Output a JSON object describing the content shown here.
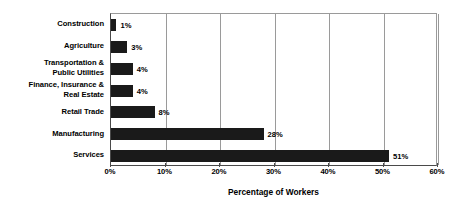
{
  "chart_data": {
    "type": "bar",
    "orientation": "horizontal",
    "title": "",
    "xlabel": "Percentage of Workers",
    "ylabel": "",
    "categories": [
      "Construction",
      "Agriculture",
      "Transportation &\nPublic Utilities",
      "Finance, Insurance &\nReal Estate",
      "Retail Trade",
      "Manufacturing",
      "Services"
    ],
    "values": [
      1,
      3,
      4,
      4,
      8,
      28,
      51
    ],
    "data_labels": [
      "1%",
      "3%",
      "4%",
      "4%",
      "8%",
      "28%",
      "51%"
    ],
    "xlim": [
      0,
      60
    ],
    "xticks": [
      0,
      10,
      20,
      30,
      40,
      50,
      60
    ],
    "xtick_labels": [
      "0%",
      "10%",
      "20%",
      "30%",
      "40%",
      "50%",
      "60%"
    ],
    "grid": "vertical",
    "legend": "none",
    "bar_color": "#1a1a1a",
    "gridline_color": "#9a9a9a",
    "axis_color": "#4a4a4a",
    "background_color": "#ffffff"
  }
}
